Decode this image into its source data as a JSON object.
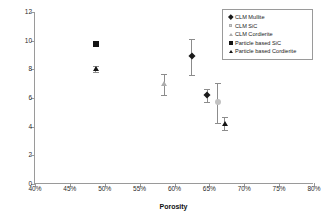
{
  "chart_data": {
    "type": "scatter",
    "title": "",
    "xlabel": "Porosity",
    "ylabel": "Axial Compression Strength (MPa)",
    "xlim": [
      40,
      80
    ],
    "ylim": [
      0,
      12
    ],
    "xticks": [
      "40%",
      "45%",
      "50%",
      "55%",
      "60%",
      "65%",
      "70%",
      "75%",
      "80%"
    ],
    "xtick_values": [
      40,
      45,
      50,
      55,
      60,
      65,
      70,
      75,
      80
    ],
    "yticks": [
      "0",
      "2",
      "4",
      "6",
      "8",
      "10",
      "12"
    ],
    "ytick_values": [
      0,
      2,
      4,
      6,
      8,
      10,
      12
    ],
    "grid": false,
    "legend_position": "top-right",
    "series": [
      {
        "name": "CLM Mullite",
        "marker": "filled-diamond",
        "color": "#1a1a1a",
        "points": [
          {
            "x": 62.5,
            "y": 8.9,
            "yerr_low": 1.3,
            "yerr_high": 1.25
          },
          {
            "x": 64.7,
            "y": 6.2,
            "yerr_low": 0.5,
            "yerr_high": 0.45
          }
        ]
      },
      {
        "name": "CLM SiC",
        "marker": "open-square",
        "color": "#c2c2c2",
        "points": [
          {
            "x": 66.2,
            "y": 5.7,
            "yerr_low": 1.45,
            "yerr_high": 1.35
          }
        ]
      },
      {
        "name": "CLM Cordierite",
        "marker": "open-triangle",
        "color": "#adadad",
        "points": [
          {
            "x": 58.5,
            "y": 6.95,
            "yerr_low": 0.75,
            "yerr_high": 0.75
          }
        ]
      },
      {
        "name": "Particle based SiC",
        "marker": "filled-square",
        "color": "#141414",
        "points": [
          {
            "x": 48.7,
            "y": 9.8,
            "yerr_low": 0.1,
            "yerr_high": 0.1
          }
        ]
      },
      {
        "name": "Particle based Cordierite",
        "marker": "filled-triangle",
        "color": "#141414",
        "points": [
          {
            "x": 48.7,
            "y": 8.0,
            "yerr_low": 0.2,
            "yerr_high": 0.2
          },
          {
            "x": 67.2,
            "y": 4.2,
            "yerr_low": 0.45,
            "yerr_high": 0.45
          }
        ]
      }
    ]
  },
  "legend": {
    "items": [
      {
        "label": "CLM Mullite",
        "swatch": "diamond-icon"
      },
      {
        "label": "CLM SiC",
        "swatch": "open-square-icon"
      },
      {
        "label": "CLM Cordierite",
        "swatch": "open-triangle-icon"
      },
      {
        "label": "Particle based SiC",
        "swatch": "filled-square-icon"
      },
      {
        "label": "Particle based Cordierite",
        "swatch": "filled-triangle-icon"
      }
    ]
  }
}
